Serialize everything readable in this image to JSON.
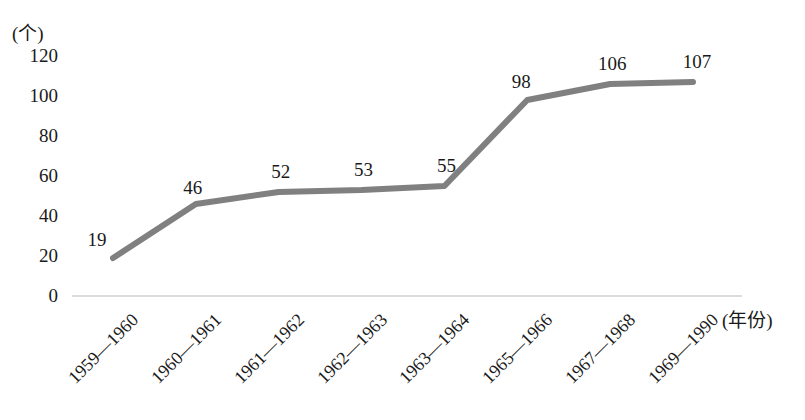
{
  "chart_data": {
    "type": "line",
    "title": "",
    "xlabel": "(年份)",
    "ylabel": "(个)",
    "categories": [
      "1959—1960",
      "1960—1961",
      "1961—1962",
      "1962—1963",
      "1963—1964",
      "1965—1966",
      "1967—1968",
      "1969—1990"
    ],
    "values": [
      19,
      46,
      52,
      53,
      55,
      98,
      106,
      107
    ],
    "value_labels": [
      "19",
      "46",
      "52",
      "53",
      "55",
      "98",
      "106",
      "107"
    ],
    "ylim": [
      0,
      120
    ],
    "yticks": [
      0,
      20,
      40,
      60,
      80,
      100,
      120
    ],
    "ytick_labels": [
      "0",
      "20",
      "40",
      "60",
      "80",
      "100",
      "120"
    ],
    "grid": false,
    "legend": null,
    "series_color": "#808080",
    "axis_color": "#cfcfcf",
    "text_color": "#1a1a1a"
  }
}
